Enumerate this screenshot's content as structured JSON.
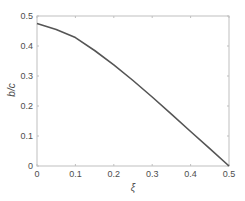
{
  "chart_data": {
    "type": "line",
    "title": "",
    "xlabel": "ξ",
    "ylabel": "b/c",
    "xlim": [
      0,
      0.5
    ],
    "ylim": [
      0,
      0.5
    ],
    "xticks": [
      0,
      0.1,
      0.2,
      0.3,
      0.4,
      0.5
    ],
    "xtick_labels": [
      "0",
      "0.1",
      "0.2",
      "0.3",
      "0.4",
      "0.5"
    ],
    "yticks": [
      0,
      0.1,
      0.2,
      0.3,
      0.4,
      0.5
    ],
    "ytick_labels": [
      "0",
      "0.1",
      "0.2",
      "0.3",
      "0.4",
      "0.5"
    ],
    "grid": false,
    "legend": null,
    "series": [
      {
        "name": "b/c",
        "color": "#555555",
        "x": [
          0,
          0.05,
          0.1,
          0.15,
          0.2,
          0.25,
          0.3,
          0.35,
          0.4,
          0.45,
          0.5
        ],
        "y": [
          0.475,
          0.455,
          0.428,
          0.385,
          0.337,
          0.285,
          0.23,
          0.173,
          0.115,
          0.058,
          0.0
        ]
      }
    ]
  },
  "colors": {
    "axis": "#bfbfbf",
    "tick_text": "#4d4d4d",
    "line": "#555555"
  }
}
